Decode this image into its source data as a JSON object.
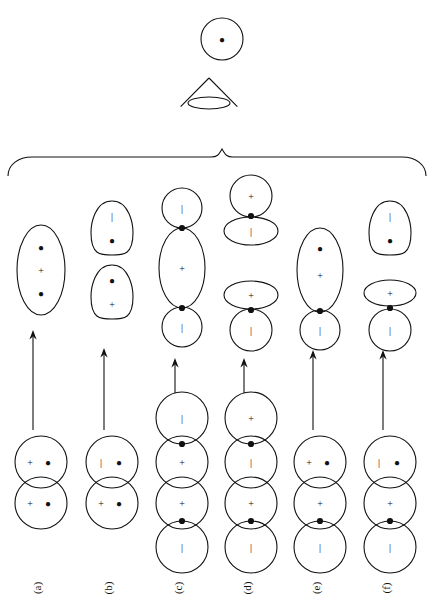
{
  "figure": {
    "title": "",
    "label_prefix": "(",
    "label_suffix": ")"
  },
  "top_shapes": [
    {
      "name": "top-circle",
      "kind": "circle",
      "cx": 222,
      "cy": 39,
      "rx": 21,
      "ry": 21,
      "contents": [
        {
          "sym": "●",
          "dx": 0,
          "dy": 0
        }
      ]
    },
    {
      "name": "top-cone",
      "kind": "cone",
      "cx": 209,
      "cy": 103,
      "rx": 21,
      "ry": 6,
      "apex_dy": -25,
      "contents": []
    }
  ],
  "brace": {
    "name": "grouping-brace",
    "x_left": 8,
    "x_right": 426,
    "y_top": 155,
    "y_bottom": 176,
    "tip_x": 222
  },
  "columns": [
    {
      "id": "a",
      "label": "(a)",
      "label_x": 41,
      "label_y": 588,
      "cx": 41,
      "arrow": {
        "x": 33,
        "y_top": 330,
        "y_bottom": 430
      },
      "product": [
        {
          "kind": "ellipse",
          "cx": 41,
          "cy": 270,
          "rx": 24,
          "ry": 45,
          "contents": [
            {
              "sym": "●",
              "dx": 0,
              "dy": -23
            },
            {
              "sym": "+",
              "dx": 0,
              "dy": 0
            },
            {
              "sym": "●",
              "dx": 0,
              "dy": 23
            }
          ]
        }
      ],
      "product_nodes": [],
      "reactant": [
        {
          "kind": "circle",
          "cx": 41,
          "cy": 462,
          "rx": 26,
          "ry": 26,
          "contents": [
            {
              "sym": "+",
              "dx": -11,
              "dy": 0
            },
            {
              "sym": "●",
              "dx": 7,
              "dy": 0
            }
          ]
        },
        {
          "kind": "circle",
          "cx": 41,
          "cy": 503,
          "rx": 26,
          "ry": 26,
          "contents": [
            {
              "sym": "+",
              "dx": -11,
              "dy": 0
            },
            {
              "sym": "●",
              "dx": 7,
              "dy": 0
            }
          ]
        }
      ],
      "reactant_nodes": []
    },
    {
      "id": "b",
      "label": "(b)",
      "label_x": 112,
      "label_y": 588,
      "cx": 112,
      "arrow": {
        "x": 104,
        "y_top": 348,
        "y_bottom": 430
      },
      "product": [
        {
          "kind": "egg",
          "cx": 112,
          "cy": 228,
          "rx": 21,
          "ry": 27,
          "contents": [
            {
              "sym": "|",
              "dx": 0,
              "dy": -12
            },
            {
              "sym": "●",
              "dx": 0,
              "dy": 12
            }
          ]
        },
        {
          "kind": "egg",
          "cx": 112,
          "cy": 292,
          "rx": 21,
          "ry": 27,
          "contents": [
            {
              "sym": "●",
              "dx": 0,
              "dy": -12
            },
            {
              "sym": "+",
              "dx": 0,
              "dy": 12
            }
          ]
        }
      ],
      "product_nodes": [],
      "reactant": [
        {
          "kind": "circle",
          "cx": 112,
          "cy": 462,
          "rx": 26,
          "ry": 26,
          "contents": [
            {
              "sym": "|",
              "dx": -11,
              "dy": 0
            },
            {
              "sym": "●",
              "dx": 7,
              "dy": 0
            }
          ]
        },
        {
          "kind": "circle",
          "cx": 112,
          "cy": 503,
          "rx": 26,
          "ry": 26,
          "contents": [
            {
              "sym": "+",
              "dx": -11,
              "dy": 0
            },
            {
              "sym": "●",
              "dx": 7,
              "dy": 0
            }
          ]
        }
      ],
      "reactant_nodes": []
    },
    {
      "id": "c",
      "label": "(c)",
      "label_x": 182,
      "label_y": 588,
      "cx": 182,
      "arrow": {
        "x": 175,
        "y_top": 358,
        "y_bottom": 393
      },
      "product": [
        {
          "kind": "circle",
          "cx": 182,
          "cy": 208,
          "rx": 20,
          "ry": 20,
          "contents": [
            {
              "sym": "|",
              "dx": 0,
              "dy": 0
            }
          ]
        },
        {
          "kind": "ellipse",
          "cx": 182,
          "cy": 268,
          "rx": 23,
          "ry": 40,
          "contents": [
            {
              "sym": "+",
              "dx": 0,
              "dy": 0
            }
          ]
        },
        {
          "kind": "circle",
          "cx": 182,
          "cy": 327,
          "rx": 20,
          "ry": 20,
          "contents": [
            {
              "sym": "|",
              "dx": 0,
              "dy": 0
            }
          ]
        }
      ],
      "product_nodes": [
        {
          "cx": 182,
          "cy": 228
        },
        {
          "cx": 182,
          "cy": 308
        }
      ],
      "reactant": [
        {
          "kind": "circle",
          "cx": 182,
          "cy": 418,
          "rx": 26,
          "ry": 26,
          "contents": [
            {
              "sym": "|",
              "dx": 0,
              "dy": 0
            }
          ]
        },
        {
          "kind": "circle",
          "cx": 182,
          "cy": 462,
          "rx": 26,
          "ry": 26,
          "contents": [
            {
              "sym": "+",
              "dx": 0,
              "dy": 0
            }
          ]
        },
        {
          "kind": "circle",
          "cx": 182,
          "cy": 503,
          "rx": 26,
          "ry": 26,
          "contents": [
            {
              "sym": "+",
              "dx": 0,
              "dy": 0
            }
          ]
        },
        {
          "kind": "circle",
          "cx": 182,
          "cy": 547,
          "rx": 26,
          "ry": 26,
          "contents": [
            {
              "sym": "|",
              "dx": 0,
              "dy": 0
            }
          ]
        }
      ],
      "reactant_nodes": [
        {
          "cx": 182,
          "cy": 444
        },
        {
          "cx": 182,
          "cy": 521
        }
      ]
    },
    {
      "id": "d",
      "label": "(d)",
      "label_x": 251,
      "label_y": 588,
      "cx": 251,
      "arrow": {
        "x": 244,
        "y_top": 358,
        "y_bottom": 393
      },
      "product": [
        {
          "kind": "circle",
          "cx": 251,
          "cy": 196,
          "rx": 21,
          "ry": 21,
          "contents": [
            {
              "sym": "+",
              "dx": 0,
              "dy": 0
            }
          ]
        },
        {
          "kind": "flat",
          "cx": 251,
          "cy": 231,
          "rx": 27,
          "ry": 14,
          "contents": [
            {
              "sym": "|",
              "dx": 0,
              "dy": 0
            }
          ]
        },
        {
          "kind": "flat",
          "cx": 251,
          "cy": 295,
          "rx": 27,
          "ry": 14,
          "contents": [
            {
              "sym": "+",
              "dx": 0,
              "dy": 0
            }
          ]
        },
        {
          "kind": "circle",
          "cx": 251,
          "cy": 330,
          "rx": 21,
          "ry": 21,
          "contents": [
            {
              "sym": "|",
              "dx": 0,
              "dy": 0
            }
          ]
        }
      ],
      "product_nodes": [
        {
          "cx": 251,
          "cy": 216
        },
        {
          "cx": 251,
          "cy": 310
        }
      ],
      "reactant": [
        {
          "kind": "circle",
          "cx": 251,
          "cy": 418,
          "rx": 26,
          "ry": 26,
          "contents": [
            {
              "sym": "+",
              "dx": 0,
              "dy": 0
            }
          ]
        },
        {
          "kind": "circle",
          "cx": 251,
          "cy": 462,
          "rx": 26,
          "ry": 26,
          "contents": [
            {
              "sym": "|",
              "dx": 0,
              "dy": 0
            }
          ]
        },
        {
          "kind": "circle",
          "cx": 251,
          "cy": 503,
          "rx": 26,
          "ry": 26,
          "contents": [
            {
              "sym": "+",
              "dx": 0,
              "dy": 0
            }
          ]
        },
        {
          "kind": "circle",
          "cx": 251,
          "cy": 547,
          "rx": 26,
          "ry": 26,
          "contents": [
            {
              "sym": "|",
              "dx": 0,
              "dy": 0
            }
          ]
        }
      ],
      "reactant_nodes": [
        {
          "cx": 251,
          "cy": 444
        },
        {
          "cx": 251,
          "cy": 521
        }
      ]
    },
    {
      "id": "e",
      "label": "(e)",
      "label_x": 320,
      "label_y": 588,
      "cx": 320,
      "arrow": {
        "x": 313,
        "y_top": 350,
        "y_bottom": 430
      },
      "product": [
        {
          "kind": "ellipse",
          "cx": 320,
          "cy": 270,
          "rx": 23,
          "ry": 42,
          "contents": [
            {
              "sym": "●",
              "dx": 0,
              "dy": -22
            },
            {
              "sym": "+",
              "dx": 0,
              "dy": 5
            }
          ]
        },
        {
          "kind": "circle",
          "cx": 320,
          "cy": 330,
          "rx": 20,
          "ry": 20,
          "contents": [
            {
              "sym": "|",
              "dx": 0,
              "dy": 0
            }
          ]
        }
      ],
      "product_nodes": [
        {
          "cx": 320,
          "cy": 311
        }
      ],
      "reactant": [
        {
          "kind": "circle",
          "cx": 320,
          "cy": 462,
          "rx": 26,
          "ry": 26,
          "contents": [
            {
              "sym": "+",
              "dx": -11,
              "dy": 0
            },
            {
              "sym": "●",
              "dx": 7,
              "dy": 0
            }
          ]
        },
        {
          "kind": "circle",
          "cx": 320,
          "cy": 503,
          "rx": 26,
          "ry": 26,
          "contents": [
            {
              "sym": "+",
              "dx": 0,
              "dy": 0
            }
          ]
        },
        {
          "kind": "circle",
          "cx": 320,
          "cy": 547,
          "rx": 26,
          "ry": 26,
          "contents": [
            {
              "sym": "|",
              "dx": 0,
              "dy": 0
            }
          ]
        }
      ],
      "reactant_nodes": [
        {
          "cx": 320,
          "cy": 521
        }
      ]
    },
    {
      "id": "f",
      "label": "(f)",
      "label_x": 390,
      "label_y": 588,
      "cx": 390,
      "arrow": {
        "x": 383,
        "y_top": 350,
        "y_bottom": 430
      },
      "product": [
        {
          "kind": "egg",
          "cx": 390,
          "cy": 228,
          "rx": 21,
          "ry": 27,
          "contents": [
            {
              "sym": "|",
              "dx": 0,
              "dy": -12
            },
            {
              "sym": "●",
              "dx": 0,
              "dy": 12
            }
          ]
        },
        {
          "kind": "flat",
          "cx": 390,
          "cy": 293,
          "rx": 26,
          "ry": 13,
          "contents": [
            {
              "sym": "+",
              "dx": 0,
              "dy": 0
            }
          ]
        },
        {
          "kind": "circle",
          "cx": 390,
          "cy": 330,
          "rx": 21,
          "ry": 21,
          "contents": [
            {
              "sym": "|",
              "dx": 0,
              "dy": 0
            }
          ]
        }
      ],
      "product_nodes": [
        {
          "cx": 390,
          "cy": 308
        }
      ],
      "reactant": [
        {
          "kind": "circle",
          "cx": 390,
          "cy": 462,
          "rx": 26,
          "ry": 26,
          "contents": [
            {
              "sym": "|",
              "dx": -11,
              "dy": 0
            },
            {
              "sym": "●",
              "dx": 7,
              "dy": 0
            }
          ]
        },
        {
          "kind": "circle",
          "cx": 390,
          "cy": 503,
          "rx": 26,
          "ry": 26,
          "contents": [
            {
              "sym": "+",
              "dx": 0,
              "dy": 0
            }
          ]
        },
        {
          "kind": "circle",
          "cx": 390,
          "cy": 547,
          "rx": 26,
          "ry": 26,
          "contents": [
            {
              "sym": "|",
              "dx": 0,
              "dy": 0
            }
          ]
        }
      ],
      "reactant_nodes": [
        {
          "cx": 390,
          "cy": 521
        }
      ]
    }
  ],
  "colors": {
    "stroke": "#111111",
    "background": "#ffffff"
  }
}
